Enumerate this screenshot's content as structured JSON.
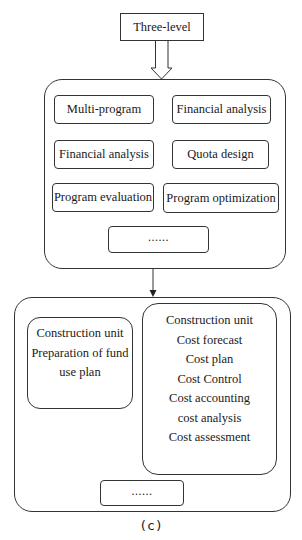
{
  "diagram": {
    "top_node": {
      "label": "Three-level"
    },
    "level_one": {
      "items": [
        {
          "label": "Multi-program"
        },
        {
          "label": "Financial analysis"
        },
        {
          "label": "Financial analysis"
        },
        {
          "label": "Quota design"
        },
        {
          "label": "Program evaluation"
        },
        {
          "label": "Program optimization"
        }
      ],
      "ellipsis": "......"
    },
    "level_two": {
      "left_box": {
        "lines": [
          "Construction unit",
          "Preparation of fund",
          "use plan"
        ]
      },
      "right_box": {
        "lines": [
          "Construction unit",
          "Cost forecast",
          "Cost plan",
          "Cost Control",
          "Cost accounting",
          "cost analysis",
          "Cost assessment"
        ]
      },
      "ellipsis": "......"
    },
    "caption": "(c)"
  }
}
